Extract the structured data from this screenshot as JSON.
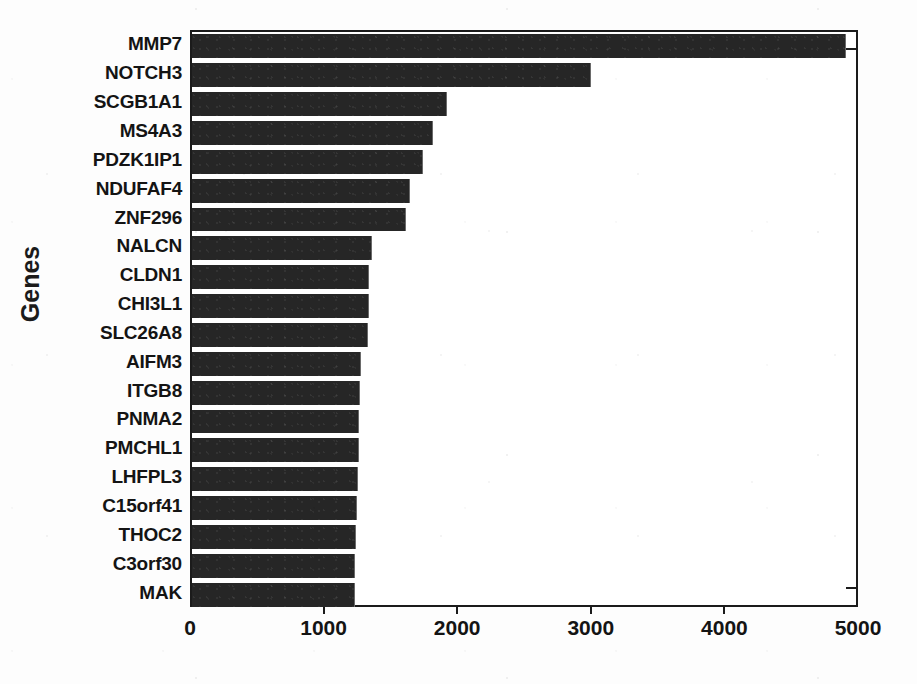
{
  "chart_data": {
    "type": "bar",
    "orientation": "horizontal",
    "title": "",
    "xlabel": "",
    "ylabel": "Genes",
    "xlim": [
      0,
      5000
    ],
    "xticks": [
      0,
      1000,
      2000,
      3000,
      4000,
      5000
    ],
    "xtick_labels": [
      "0",
      "1000",
      "2000",
      "3000",
      "4000",
      "5000"
    ],
    "grid": false,
    "legend": null,
    "bar_color": "#262626",
    "categories": [
      "MMP7",
      "NOTCH3",
      "SCGB1A1",
      "MS4A3",
      "PDZK1IP1",
      "NDUFAF4",
      "ZNF296",
      "NALCN",
      "CLDN1",
      "CHI3L1",
      "SLC26A8",
      "AIFM3",
      "ITGB8",
      "PNMA2",
      "PMCHL1",
      "LHFPL3",
      "C15orf41",
      "THOC2",
      "C3orf30",
      "MAK"
    ],
    "values": [
      4890,
      2980,
      1900,
      1795,
      1720,
      1625,
      1595,
      1340,
      1320,
      1315,
      1310,
      1255,
      1250,
      1245,
      1240,
      1235,
      1225,
      1220,
      1215,
      1210
    ]
  },
  "axis": {
    "y_title": "Genes"
  }
}
